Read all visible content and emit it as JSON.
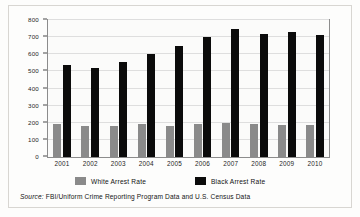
{
  "chart_data": {
    "type": "bar",
    "title": "",
    "subtitle": "",
    "xlabel": "",
    "ylabel": "Arrest Rates per 100,000",
    "categories": [
      "2001",
      "2002",
      "2003",
      "2004",
      "2005",
      "2006",
      "2007",
      "2008",
      "2009",
      "2010"
    ],
    "series": [
      {
        "name": "White Arrest Rate",
        "color": "#8a8a8a",
        "values": [
          190,
          180,
          183,
          192,
          183,
          193,
          200,
          195,
          188,
          185
        ]
      },
      {
        "name": "Black Arrest Rate",
        "color": "#0b0b0b",
        "values": [
          540,
          520,
          557,
          603,
          650,
          700,
          745,
          718,
          728,
          710
        ]
      }
    ],
    "ylim": [
      0,
      800
    ],
    "yticks": [
      0,
      100,
      200,
      300,
      400,
      500,
      600,
      700,
      800
    ],
    "ytick_labels": [
      "0",
      "100",
      "200",
      "300",
      "400",
      "500",
      "600",
      "700",
      "800"
    ],
    "grid": true,
    "legend_position": "bottom",
    "annotations": {
      "source_label": "Source:",
      "source_text": "FBI/Uniform Crime Reporting Program Data and U.S. Census Data"
    }
  },
  "legend": {
    "entries": [
      {
        "label": "White Arrest Rate",
        "swatch": "white-rate"
      },
      {
        "label": "Black Arrest Rate",
        "swatch": "black-rate"
      }
    ]
  },
  "source": {
    "label": "Source:",
    "text": "FBI/Uniform Crime Reporting Program Data and U.S. Census Data"
  }
}
